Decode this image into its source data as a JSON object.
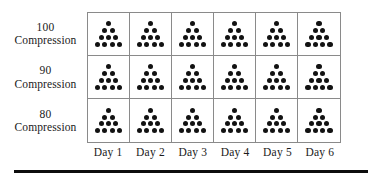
{
  "figure": {
    "name": "dot-array-grid",
    "row_header_suffix": "Compression",
    "rows": [
      {
        "value": "100",
        "unit": "Compression"
      },
      {
        "value": "90",
        "unit": "Compression"
      },
      {
        "value": "80",
        "unit": "Compression"
      }
    ],
    "columns": [
      {
        "label": "Day 1"
      },
      {
        "label": "Day 2"
      },
      {
        "label": "Day 3"
      },
      {
        "label": "Day 4"
      },
      {
        "label": "Day 5"
      },
      {
        "label": "Day 6"
      }
    ],
    "cell_glyph": "dot-triangle",
    "dot_color": "#121212",
    "grid_line_color": "#8a8a8a",
    "rule_color": "#0d0d0d",
    "background": "#ffffff"
  },
  "chart_data": {
    "type": "table",
    "title": "",
    "xlabel": "",
    "ylabel": "",
    "row_categories": [
      "100 Compression",
      "90 Compression",
      "80 Compression"
    ],
    "categories": [
      "Day 1",
      "Day 2",
      "Day 3",
      "Day 4",
      "Day 5",
      "Day 6"
    ],
    "cell_encoding": "triangular dot array, rows of 1-2-3-4 dots",
    "dots_per_row_pattern": [
      1,
      2,
      3,
      4
    ],
    "series": [
      {
        "name": "100 Compression",
        "values": [
          10,
          10,
          10,
          10,
          10,
          10
        ]
      },
      {
        "name": "90 Compression",
        "values": [
          10,
          10,
          10,
          10,
          10,
          10
        ]
      },
      {
        "name": "80 Compression",
        "values": [
          10,
          10,
          10,
          10,
          10,
          10
        ]
      }
    ],
    "grid": true,
    "legend": "none"
  }
}
